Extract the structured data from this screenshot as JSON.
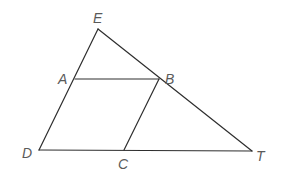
{
  "diagram": {
    "type": "geometry",
    "points": {
      "E": {
        "label": "E",
        "x": 98,
        "y": 29,
        "lx": 93,
        "ly": 23
      },
      "A": {
        "label": "A",
        "x": 75,
        "y": 79,
        "lx": 58,
        "ly": 84
      },
      "B": {
        "label": "B",
        "x": 159,
        "y": 79,
        "lx": 165,
        "ly": 84
      },
      "D": {
        "label": "D",
        "x": 39,
        "y": 150,
        "lx": 22,
        "ly": 158
      },
      "C": {
        "label": "C",
        "x": 124,
        "y": 150,
        "lx": 118,
        "ly": 169
      },
      "T": {
        "label": "T",
        "x": 252,
        "y": 151,
        "lx": 256,
        "ly": 161
      }
    },
    "segments": [
      {
        "from": "E",
        "to": "D",
        "name": "segment-ED"
      },
      {
        "from": "E",
        "to": "T",
        "name": "segment-ET"
      },
      {
        "from": "D",
        "to": "T",
        "name": "segment-DT"
      },
      {
        "from": "A",
        "to": "B",
        "name": "segment-AB"
      },
      {
        "from": "B",
        "to": "C",
        "name": "segment-BC"
      }
    ],
    "colors": {
      "line": "#2e2e2e",
      "label": "#5a5a5a",
      "background": "#ffffff"
    }
  }
}
